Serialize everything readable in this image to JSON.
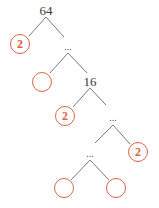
{
  "diagram": {
    "type": "factor-tree",
    "colors": {
      "line": "#7a7a7a",
      "circle": "#e0644a",
      "text": "#3a3a3a"
    },
    "nodes": [
      {
        "id": "root",
        "label": "64",
        "kind": "number",
        "x": 46,
        "y": 10
      },
      {
        "id": "f1",
        "label": "2",
        "kind": "circle",
        "x": 20,
        "y": 44
      },
      {
        "id": "d1",
        "label": "...",
        "kind": "ellipsis",
        "x": 68,
        "y": 48
      },
      {
        "id": "f2",
        "label": "",
        "kind": "circle",
        "x": 42,
        "y": 82
      },
      {
        "id": "n16",
        "label": "16",
        "kind": "number",
        "x": 90,
        "y": 81
      },
      {
        "id": "f3",
        "label": "2",
        "kind": "circle",
        "x": 65,
        "y": 116
      },
      {
        "id": "d2",
        "label": "...",
        "kind": "ellipsis",
        "x": 113,
        "y": 119
      },
      {
        "id": "f4",
        "label": "2",
        "kind": "circle",
        "x": 138,
        "y": 152
      },
      {
        "id": "d3",
        "label": "...",
        "kind": "ellipsis",
        "x": 90,
        "y": 155
      },
      {
        "id": "f5",
        "label": "",
        "kind": "circle",
        "x": 64,
        "y": 188
      },
      {
        "id": "f6",
        "label": "",
        "kind": "circle",
        "x": 116,
        "y": 188
      }
    ],
    "edges": [
      [
        46,
        17,
        29,
        36
      ],
      [
        46,
        17,
        64,
        37
      ],
      [
        68,
        53,
        50,
        73
      ],
      [
        68,
        53,
        87,
        73
      ],
      [
        90,
        88,
        73,
        107
      ],
      [
        90,
        88,
        106,
        105
      ],
      [
        113,
        125,
        95,
        143
      ],
      [
        113,
        125,
        130,
        144
      ],
      [
        90,
        160,
        71,
        180
      ],
      [
        90,
        160,
        109,
        180
      ]
    ]
  }
}
